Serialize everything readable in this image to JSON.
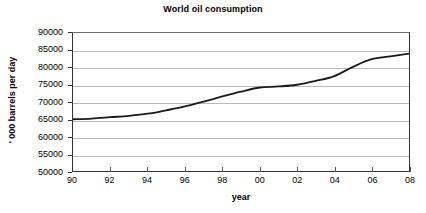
{
  "chart_data": {
    "type": "line",
    "title": "World oil consumption",
    "xlabel": "year",
    "ylabel": "' 000 barrels per day",
    "x": [
      90,
      91,
      92,
      93,
      94,
      95,
      96,
      97,
      98,
      99,
      0,
      1,
      2,
      3,
      4,
      5,
      6,
      7,
      8
    ],
    "x_tick_labels": [
      "90",
      "92",
      "94",
      "96",
      "98",
      "00",
      "02",
      "04",
      "06",
      "08"
    ],
    "x_tick_values": [
      90,
      92,
      94,
      96,
      98,
      100,
      102,
      104,
      106,
      108
    ],
    "xlim": [
      90,
      108
    ],
    "categories": [
      "1990",
      "1991",
      "1992",
      "1993",
      "1994",
      "1995",
      "1996",
      "1997",
      "1998",
      "1999",
      "2000",
      "2001",
      "2002",
      "2003",
      "2004",
      "2005",
      "2006",
      "2007",
      "2008"
    ],
    "values": [
      65000,
      65200,
      65600,
      66000,
      66600,
      67600,
      68700,
      70100,
      71600,
      73000,
      74200,
      74500,
      75000,
      76100,
      77500,
      80200,
      82400,
      83200,
      84000
    ],
    "y_tick_labels": [
      "90000",
      "85000",
      "80000",
      "75000",
      "70000",
      "65000",
      "60000",
      "55000",
      "50000"
    ],
    "y_tick_values": [
      90000,
      85000,
      80000,
      75000,
      70000,
      65000,
      60000,
      55000,
      50000
    ],
    "ylim": [
      50000,
      90000
    ],
    "y_step": 5000,
    "grid": true,
    "legend": false,
    "series": [
      {
        "name": "World oil consumption",
        "color": "#1a1a1a",
        "line_width": 1.8,
        "values": [
          65000,
          65200,
          65600,
          66000,
          66600,
          67600,
          68700,
          70100,
          71600,
          73000,
          74200,
          74500,
          75000,
          76100,
          77500,
          80200,
          82400,
          83200,
          84000
        ]
      }
    ],
    "colors": {
      "line": "#1a1a1a",
      "gridline": "#b9b9b9",
      "axis": "#333333",
      "background": "#ffffff",
      "text": "#000000"
    }
  }
}
